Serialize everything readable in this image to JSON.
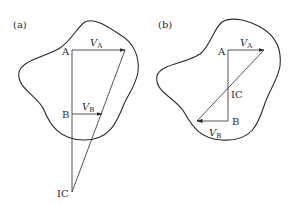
{
  "figure": {
    "panels": [
      {
        "id": "a",
        "label": "(a)",
        "point_a": "A",
        "point_b": "B",
        "point_ic": "IC",
        "velocity_a": {
          "symbol": "V",
          "sub": "A"
        },
        "velocity_b": {
          "symbol": "V",
          "sub": "B"
        }
      },
      {
        "id": "b",
        "label": "(b)",
        "point_a": "A",
        "point_b": "B",
        "point_ic": "IC",
        "velocity_a": {
          "symbol": "V",
          "sub": "A"
        },
        "velocity_b": {
          "symbol": "V",
          "sub": "B"
        }
      }
    ],
    "colors": {
      "stroke": "#2a2a2a",
      "background": "#ffffff"
    }
  }
}
